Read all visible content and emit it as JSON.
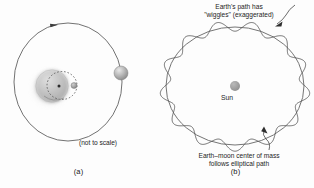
{
  "figure": {
    "background": "#fdfdfd",
    "width": 314,
    "height": 188
  },
  "colors": {
    "stroke": "#4a4a4a",
    "text": "#1a1a1a",
    "sun_fill": "#9a9a9a",
    "earth_fill": "#bdbdbd",
    "moon_fill": "#8d8d8d",
    "dashed": "#5a5a5a"
  },
  "panel_a": {
    "caption": "(a)",
    "scale_note": "(not to scale)",
    "bodies": [
      {
        "name": "earth",
        "label": "",
        "kind": "sphere",
        "cx": 52,
        "cy": 86,
        "r": 17
      },
      {
        "name": "moon",
        "label": "",
        "kind": "sphere",
        "cx": 74,
        "cy": 86,
        "r": 3.1
      },
      {
        "name": "center-of-mass",
        "label": "",
        "kind": "point",
        "cx": 59,
        "cy": 86,
        "r": 1.6
      },
      {
        "name": "sun",
        "label": "",
        "kind": "sphere",
        "cx": 121,
        "cy": 73,
        "r": 7.2
      }
    ],
    "orbit": {
      "name": "earth-orbit-ellipse",
      "cx": 68,
      "cy": 82,
      "rx": 54,
      "ry": 59,
      "direction_arrow_at_top": true
    },
    "moon_orbit": {
      "name": "moon-orbit-dashed",
      "cx": 62,
      "cy": 85,
      "rx": 15,
      "ry": 14,
      "style": "dashed"
    }
  },
  "panel_b": {
    "caption": "(b)",
    "sun": {
      "label": "Sun",
      "cx": 78,
      "cy": 86,
      "r": 5.2
    },
    "annotations": [
      {
        "name": "wiggle-annotation",
        "lines": [
          "Earth's path has",
          "\"wiggles\" (exaggerated)"
        ],
        "leader_arrow": true,
        "position": "top-right"
      },
      {
        "name": "barycenter-annotation",
        "lines": [
          "Earth–moon center of mass",
          "follows elliptical path"
        ],
        "leader_arrow": true,
        "position": "bottom-right"
      }
    ],
    "paths": [
      {
        "name": "center-of-mass-elliptical-path",
        "type": "ellipse",
        "cx": 78,
        "cy": 86,
        "rx": 70,
        "ry": 60
      },
      {
        "name": "earth-wiggly-path",
        "type": "sinusoid-on-ellipse",
        "cx": 78,
        "cy": 86,
        "rx": 70,
        "ry": 60,
        "wiggle_count": 13,
        "wiggle_amplitude": 5.2
      }
    ]
  },
  "chart_data": {
    "type": "diagram",
    "panels": [
      {
        "id": "a",
        "label": "(a)",
        "description": "Earth and Moon orbiting their common center of mass, shown on a large orbit around the Sun",
        "annotations": [
          "(not to scale)"
        ]
      },
      {
        "id": "b",
        "label": "(b)",
        "description": "Earth's wiggly path about the Sun, with the Earth-moon center of mass tracing a smooth ellipse",
        "annotations": [
          "Earth's path has \"wiggles\" (exaggerated)",
          "Earth–moon center of mass follows elliptical path",
          "Sun"
        ],
        "wiggle_count": 13
      }
    ]
  }
}
